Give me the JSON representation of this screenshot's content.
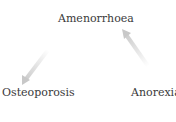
{
  "diagram": {
    "nodes": [
      {
        "id": "amenorrhoea",
        "label": "Amenorrhoea"
      },
      {
        "id": "osteoporosis",
        "label": "Osteoporosis"
      },
      {
        "id": "anorexia",
        "label": "Anorexia"
      }
    ],
    "edges": [
      {
        "from": "amenorrhoea",
        "to": "osteoporosis",
        "style": "faded-gradient-arrow"
      },
      {
        "from": "anorexia",
        "to": "amenorrhoea",
        "style": "faded-gradient-arrow"
      }
    ],
    "arrow_color": "#c8c8c8"
  }
}
